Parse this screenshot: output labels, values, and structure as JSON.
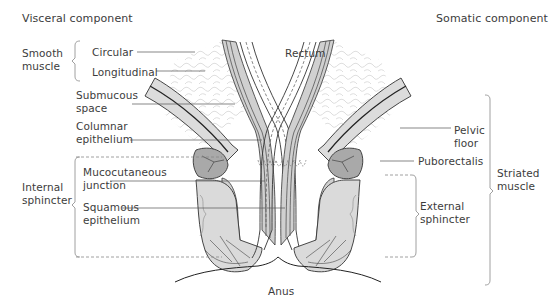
{
  "diagram": {
    "headers": {
      "left": "Visceral component",
      "right": "Somatic component"
    },
    "center_labels": {
      "rectum": "Rectum",
      "anus": "Anus"
    },
    "left_groups": {
      "smooth_muscle": "Smooth\nmuscle",
      "internal_sphincter": "Internal\nsphincter"
    },
    "left_labels": {
      "circular": "Circular",
      "longitudinal": "Longitudinal",
      "submucous_space": "Submucous\nspace",
      "columnar_epithelium": "Columnar\nepithelium",
      "mucocutaneous_junction": "Mucocutaneous\njunction",
      "squamous_epithelium": "Squamous\nepithelium"
    },
    "right_labels": {
      "pelvic_floor": "Pelvic\nfloor",
      "puborectalis": "Puborectalis",
      "external_sphincter": "External\nsphincter"
    },
    "right_groups": {
      "striated_muscle": "Striated\nmuscle"
    },
    "colors": {
      "text": "#3c3c3c",
      "outline": "#333333",
      "muscle_fill": "#d9d9d9",
      "dark_muscle_fill": "#a8a8a8",
      "leader_line": "#555555",
      "bracket": "#888888"
    }
  }
}
